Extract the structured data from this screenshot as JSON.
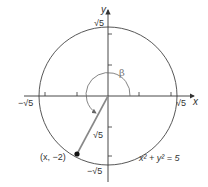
{
  "diagram": {
    "type": "unit-circle-angle",
    "circle_equation": "x² + y² = 5",
    "axes": {
      "x_label": "x",
      "y_label": "y",
      "x_pos_tick": "√5",
      "x_neg_tick": "−√5",
      "y_pos_tick": "√5",
      "y_neg_tick": "−√5"
    },
    "point": {
      "label": "(x, −2)"
    },
    "segment_label": "√5",
    "angle_label": "β",
    "colors": {
      "axis": "#333333",
      "circle": "#444444",
      "segment": "#888888",
      "arc": "#777777",
      "point": "#111111"
    }
  }
}
